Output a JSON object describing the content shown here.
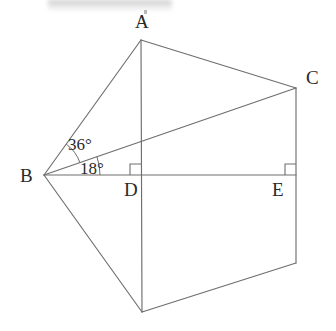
{
  "figure": {
    "canvas": {
      "width": 336,
      "height": 331
    },
    "line_color": "#6e6e6e",
    "text_color": "#2a2a2a",
    "background_color": "#ffffff",
    "points": {
      "A": {
        "x": 141,
        "y": 40,
        "label": "A",
        "label_x": 135,
        "label_y": 28
      },
      "B": {
        "x": 44,
        "y": 175,
        "label": "B",
        "label_x": 20,
        "label_y": 182
      },
      "C": {
        "x": 296,
        "y": 88,
        "label": "C",
        "label_x": 306,
        "label_y": 84
      },
      "D": {
        "x": 141,
        "y": 175,
        "label": "D",
        "label_x": 124,
        "label_y": 196
      },
      "E": {
        "x": 296,
        "y": 175,
        "label": "E",
        "label_x": 272,
        "label_y": 196
      },
      "F": {
        "x": 142,
        "y": 312,
        "label": "",
        "label_x": 0,
        "label_y": 0
      },
      "G": {
        "x": 296,
        "y": 263,
        "label": "",
        "label_x": 0,
        "label_y": 0
      }
    },
    "segments": [
      {
        "name": "segment-BA",
        "from": "B",
        "to": "A"
      },
      {
        "name": "segment-AC",
        "from": "A",
        "to": "C"
      },
      {
        "name": "segment-CG",
        "from": "C",
        "to": "G"
      },
      {
        "name": "segment-GF",
        "from": "G",
        "to": "F"
      },
      {
        "name": "segment-FB",
        "from": "F",
        "to": "B"
      },
      {
        "name": "segment-AF",
        "from": "A",
        "to": "F"
      },
      {
        "name": "segment-BE",
        "from": "B",
        "to": "E"
      },
      {
        "name": "segment-BC",
        "from": "B",
        "to": "C"
      }
    ],
    "angles": [
      {
        "name": "angle-ABC",
        "value": "36°",
        "vertex": "B",
        "between": [
          "A",
          "C"
        ],
        "label_x": 68,
        "label_y": 150,
        "arc_radius": 38
      },
      {
        "name": "angle-CBE",
        "value": "18°",
        "vertex": "B",
        "between": [
          "C",
          "E"
        ],
        "label_x": 80,
        "label_y": 174,
        "arc_radius": 56
      }
    ],
    "right_angles": [
      {
        "name": "right-angle-at-D",
        "at": "D",
        "size": 11,
        "dir_x": -1,
        "dir_y": -1
      },
      {
        "name": "right-angle-at-E",
        "at": "E",
        "size": 11,
        "dir_x": -1,
        "dir_y": -1
      }
    ],
    "artifacts": {
      "scan_smudge_label": "scan-smudge"
    }
  }
}
